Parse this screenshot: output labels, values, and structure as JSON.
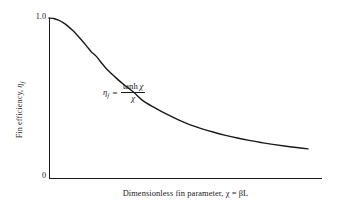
{
  "figure": {
    "background": "#ffffff",
    "ink": "#1a1a1a"
  },
  "axes": {
    "x_label": "Dimensionless fin parameter, χ = βL",
    "y_label_prefix": "Fin efficiency, ",
    "y_label_symbol": "η",
    "y_label_subscript": "f",
    "y_ticks": [
      "1.0",
      "0"
    ],
    "x_ticks": [],
    "grid": "off"
  },
  "annotation": {
    "equation_lhs_symbol": "η",
    "equation_lhs_subscript": "f",
    "equation_equals": "=",
    "equation_numerator_fn": "tanh",
    "equation_numerator_var": "χ",
    "equation_denominator": "χ"
  },
  "chart_data": {
    "type": "line",
    "title": "",
    "subtitle": "",
    "xlabel": "Dimensionless fin parameter, χ = βL",
    "ylabel": "Fin efficiency, η_f",
    "xlim": [
      0,
      5.5
    ],
    "ylim": [
      0,
      1.0
    ],
    "grid": false,
    "legend": null,
    "annotations": [
      {
        "text": "η_f = tanh χ / χ",
        "x": 1.1,
        "y": 0.56
      }
    ],
    "ytick_labels": [
      "0",
      "1.0"
    ],
    "ytick_values": [
      0,
      1.0
    ],
    "xtick_labels": [],
    "series": [
      {
        "name": "η_f = tanh(χ)/χ",
        "function": "tanh(x)/x",
        "color": "#1a1a1a",
        "linewidth": 1.4,
        "x": [
          0,
          0.1,
          0.2,
          0.3,
          0.4,
          0.5,
          0.6,
          0.7,
          0.8,
          0.9,
          1.0,
          1.2,
          1.4,
          1.6,
          1.8,
          2.0,
          2.25,
          2.5,
          2.75,
          3.0,
          3.25,
          3.5,
          3.75,
          4.0,
          4.25,
          4.5,
          4.75,
          5.0,
          5.25,
          5.5
        ],
        "y": [
          1.0,
          0.9967,
          0.9868,
          0.9709,
          0.9493,
          0.923,
          0.8928,
          0.8597,
          0.8245,
          0.7881,
          0.7616,
          0.6893,
          0.6321,
          0.5808,
          0.5357,
          0.482,
          0.4388,
          0.3987,
          0.363,
          0.3317,
          0.3068,
          0.2857,
          0.2666,
          0.25,
          0.2353,
          0.2222,
          0.2105,
          0.2,
          0.1905,
          0.1818
        ]
      }
    ]
  },
  "plot_geometry": {
    "left": 49,
    "right": 322,
    "top": 18,
    "bottom": 178,
    "curve_end_x": 308
  }
}
